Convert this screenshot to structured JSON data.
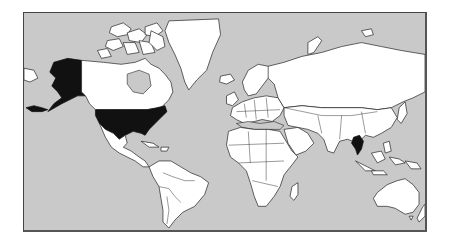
{
  "map": {
    "type": "world-political-outline",
    "projection": "mercator",
    "colors": {
      "ocean": "#c9c9c9",
      "land": "#ffffff",
      "highlight": "#111111",
      "border": "#222222"
    },
    "highlighted_regions": [
      {
        "name": "United States (contiguous)",
        "key": "usa"
      },
      {
        "name": "Alaska",
        "key": "alaska"
      },
      {
        "name": "Thailand",
        "key": "thailand"
      }
    ]
  }
}
